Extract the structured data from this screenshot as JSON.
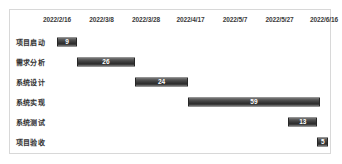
{
  "chart_data": {
    "type": "bar",
    "subtype": "gantt",
    "title": "",
    "xlabel": "",
    "ylabel": "",
    "grid": false,
    "legend": "none",
    "orientation": "horizontal",
    "axis_tick_labels": [
      "2022/2/16",
      "2022/3/8",
      "2022/3/28",
      "2022/4/17",
      "2022/5/7",
      "2022/5/27",
      "2022/6/16"
    ],
    "axis_tick_days": [
      0,
      20,
      40,
      60,
      80,
      100,
      120
    ],
    "xlim_days": [
      0,
      120
    ],
    "categories": [
      "项目启动",
      "需求分析",
      "系统设计",
      "系统实现",
      "系统测试",
      "项目验收"
    ],
    "values": [
      9,
      26,
      24,
      59,
      13,
      5
    ],
    "starts_days": [
      0,
      9,
      35,
      59,
      104,
      117
    ],
    "bar_color": "#3b3b3b",
    "bar_border_color": "#262626",
    "value_label_color": "#ffffff",
    "tasks": [
      {
        "name": "项目启动",
        "start_day": 0,
        "duration": 9,
        "label": "9"
      },
      {
        "name": "需求分析",
        "start_day": 9,
        "duration": 26,
        "label": "26"
      },
      {
        "name": "系统设计",
        "start_day": 35,
        "duration": 24,
        "label": "24"
      },
      {
        "name": "系统实现",
        "start_day": 59,
        "duration": 59,
        "label": "59"
      },
      {
        "name": "系统测试",
        "start_day": 104,
        "duration": 13,
        "label": "13"
      },
      {
        "name": "项目验收",
        "start_day": 117,
        "duration": 5,
        "label": "5"
      }
    ]
  },
  "card": {
    "border_color": "#d8d8d8",
    "background": "#ffffff"
  }
}
